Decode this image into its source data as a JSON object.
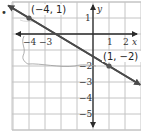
{
  "bullet": "•",
  "chart_data": {
    "type": "line",
    "title": "",
    "xlabel": "x",
    "ylabel": "y",
    "xlim": [
      -5,
      3
    ],
    "ylim": [
      -6,
      2
    ],
    "grid": true,
    "x_ticks_labeled": [
      -4,
      -3,
      1,
      2
    ],
    "y_ticks_labeled": [
      1,
      -2,
      -3,
      -4,
      -5
    ],
    "tick_labels": {
      "x": [
        "−4",
        "−3",
        "1",
        "2"
      ],
      "y": [
        "1",
        "−2",
        "−3",
        "−4",
        "−5"
      ]
    },
    "series": [
      {
        "name": "line",
        "slope": -0.6,
        "intercept": -1.4,
        "points": [
          {
            "x": -4,
            "y": 1,
            "label": "(−4, 1)"
          },
          {
            "x": 1,
            "y": -2,
            "label": "(1, −2)"
          }
        ]
      }
    ],
    "annotations": [
      "(−4, 1)",
      "(1, −2)"
    ],
    "colors": {
      "line": "#4a4a4a",
      "axis": "#2a2a2a",
      "grid": "#c4c4c4",
      "point": "#555555",
      "pencil": "#9a9a9a"
    }
  }
}
